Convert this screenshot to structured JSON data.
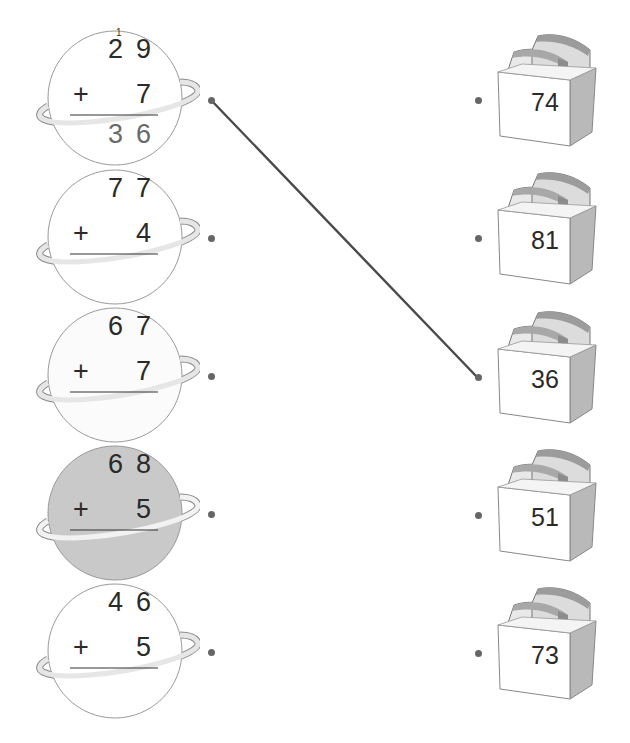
{
  "exercise": {
    "instructions_visible": false,
    "problems": [
      {
        "top": [
          "2",
          "9"
        ],
        "operator": "+",
        "addend": "7",
        "answer": [
          "3",
          "6"
        ],
        "carry": "1",
        "shaded": false
      },
      {
        "top": [
          "7",
          "7"
        ],
        "operator": "+",
        "addend": "4",
        "answer": [
          "",
          ""
        ],
        "carry": "",
        "shaded": false
      },
      {
        "top": [
          "6",
          "7"
        ],
        "operator": "+",
        "addend": "7",
        "answer": [
          "",
          ""
        ],
        "carry": "",
        "shaded": false
      },
      {
        "top": [
          "6",
          "8"
        ],
        "operator": "+",
        "addend": "5",
        "answer": [
          "",
          ""
        ],
        "carry": "",
        "shaded": true
      },
      {
        "top": [
          "4",
          "6"
        ],
        "operator": "+",
        "addend": "5",
        "answer": [
          "",
          ""
        ],
        "carry": "",
        "shaded": false
      }
    ],
    "boxes": [
      {
        "value": "74"
      },
      {
        "value": "81"
      },
      {
        "value": "36"
      },
      {
        "value": "51"
      },
      {
        "value": "73"
      }
    ],
    "connections": [
      {
        "from_problem": 0,
        "to_box": 2
      }
    ],
    "colors": {
      "ink": "#2a2a2a",
      "answer_ink": "#6a6a6a",
      "shaded_planet": "#c9c9c9",
      "ring": "#e6e6e6",
      "ring_edge": "#8a8a8a",
      "box_side": "#b9b9b9",
      "line": "#4a4a4a"
    }
  }
}
